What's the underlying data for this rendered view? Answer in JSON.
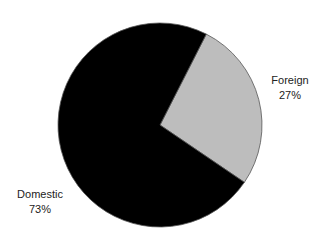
{
  "chart_data": {
    "type": "pie",
    "title": "",
    "slices": [
      {
        "label": "Foreign",
        "value": 27,
        "display": "27%",
        "color": "#bdbdbd"
      },
      {
        "label": "Domestic",
        "value": 73,
        "display": "73%",
        "color": "#000000"
      }
    ],
    "start_angle_deg": 27,
    "legend": "none"
  },
  "labels": {
    "foreign": {
      "name": "Foreign",
      "pct": "27%"
    },
    "domestic": {
      "name": "Domestic",
      "pct": "73%"
    }
  }
}
